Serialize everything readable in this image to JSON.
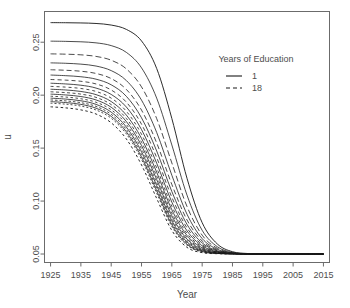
{
  "chart_data": {
    "type": "line",
    "title": "",
    "xlabel": "Year",
    "ylabel": "u",
    "xlim": [
      1923,
      2017
    ],
    "ylim": [
      0.042,
      0.279
    ],
    "xticks": [
      1925,
      1935,
      1945,
      1955,
      1965,
      1975,
      1985,
      1995,
      2005,
      2015
    ],
    "xtick_labels": [
      "1925",
      "1935",
      "1945",
      "1955",
      "1965",
      "1975",
      "1985",
      "1995",
      "2005",
      "2015"
    ],
    "yticks": [
      0.05,
      0.1,
      0.15,
      0.2,
      0.25
    ],
    "ytick_labels": [
      "0.05",
      "0.10",
      "0.15",
      "0.20",
      "0.25"
    ],
    "grid": false,
    "legend": {
      "title": "Years of Education",
      "position": "top-right",
      "entries": [
        {
          "label": "1",
          "dash": "solid"
        },
        {
          "label": "18",
          "dash": "dashed"
        }
      ]
    },
    "series_note": "18 logistic decay curves, one per year of education (1 = top/solid, 18 = bottom/dashed). All start on a plateau in 1925 and converge to u = 0.05 after ~1995.",
    "x": [
      1925,
      1930,
      1935,
      1940,
      1945,
      1950,
      1955,
      1960,
      1965,
      1970,
      1975,
      1980,
      1985,
      1990,
      1995,
      2000,
      2005,
      2010,
      2015
    ],
    "series": [
      {
        "name": "1",
        "values": [
          0.2685,
          0.2684,
          0.2682,
          0.2677,
          0.2662,
          0.2621,
          0.2512,
          0.2252,
          0.178,
          0.1215,
          0.0796,
          0.0595,
          0.0522,
          0.0505,
          0.0501,
          0.05,
          0.05,
          0.05,
          0.05
        ]
      },
      {
        "name": "2",
        "values": [
          0.251,
          0.2508,
          0.2504,
          0.2494,
          0.2468,
          0.2404,
          0.2258,
          0.1972,
          0.153,
          0.1056,
          0.0724,
          0.0569,
          0.0515,
          0.0503,
          0.05,
          0.05,
          0.05,
          0.05,
          0.05
        ]
      },
      {
        "name": "3",
        "values": [
          0.239,
          0.2387,
          0.2381,
          0.2366,
          0.233,
          0.2248,
          0.2078,
          0.1779,
          0.136,
          0.0949,
          0.0678,
          0.0554,
          0.0511,
          0.0502,
          0.05,
          0.05,
          0.05,
          0.05,
          0.05
        ]
      },
      {
        "name": "4",
        "values": [
          0.2305,
          0.2301,
          0.2293,
          0.2275,
          0.2232,
          0.2138,
          0.1953,
          0.1648,
          0.1244,
          0.0876,
          0.0646,
          0.0544,
          0.0509,
          0.0502,
          0.05,
          0.05,
          0.05,
          0.05,
          0.05
        ]
      },
      {
        "name": "5",
        "values": [
          0.224,
          0.2235,
          0.2226,
          0.2205,
          0.2157,
          0.2054,
          0.1859,
          0.1549,
          0.1157,
          0.0822,
          0.0623,
          0.0536,
          0.0508,
          0.0501,
          0.05,
          0.05,
          0.05,
          0.05,
          0.05
        ]
      },
      {
        "name": "6",
        "values": [
          0.219,
          0.2184,
          0.2174,
          0.2151,
          0.2098,
          0.1989,
          0.1786,
          0.1473,
          0.109,
          0.078,
          0.0605,
          0.053,
          0.0507,
          0.0501,
          0.05,
          0.05,
          0.05,
          0.05,
          0.05
        ]
      },
      {
        "name": "7",
        "values": [
          0.2148,
          0.2142,
          0.2131,
          0.2106,
          0.2049,
          0.1934,
          0.1726,
          0.1411,
          0.1036,
          0.0747,
          0.059,
          0.0525,
          0.0506,
          0.0501,
          0.05,
          0.05,
          0.05,
          0.05,
          0.05
        ]
      },
      {
        "name": "8",
        "values": [
          0.2113,
          0.2106,
          0.2094,
          0.2067,
          0.2007,
          0.1888,
          0.1675,
          0.1358,
          0.099,
          0.0719,
          0.0578,
          0.0522,
          0.0505,
          0.0501,
          0.05,
          0.05,
          0.05,
          0.05,
          0.05
        ]
      },
      {
        "name": "9",
        "values": [
          0.2083,
          0.2076,
          0.2063,
          0.2035,
          0.1972,
          0.1848,
          0.1631,
          0.1313,
          0.0951,
          0.0695,
          0.0568,
          0.0518,
          0.0505,
          0.0501,
          0.05,
          0.05,
          0.05,
          0.05,
          0.05
        ]
      },
      {
        "name": "10",
        "values": [
          0.2056,
          0.2049,
          0.2035,
          0.2005,
          0.194,
          0.1812,
          0.1592,
          0.1273,
          0.0918,
          0.0675,
          0.0559,
          0.0516,
          0.0504,
          0.0501,
          0.05,
          0.05,
          0.05,
          0.05,
          0.05
        ]
      },
      {
        "name": "11",
        "values": [
          0.2032,
          0.2024,
          0.201,
          0.1979,
          0.1911,
          0.178,
          0.1556,
          0.1237,
          0.0888,
          0.0657,
          0.0551,
          0.0513,
          0.0504,
          0.0501,
          0.05,
          0.05,
          0.05,
          0.05,
          0.05
        ]
      },
      {
        "name": "12",
        "values": [
          0.201,
          0.2002,
          0.1987,
          0.1955,
          0.1886,
          0.1751,
          0.1524,
          0.1204,
          0.0861,
          0.0641,
          0.0544,
          0.0511,
          0.0503,
          0.0501,
          0.05,
          0.05,
          0.05,
          0.05,
          0.05
        ]
      },
      {
        "name": "13",
        "values": [
          0.199,
          0.1982,
          0.1966,
          0.1933,
          0.1862,
          0.1724,
          0.1494,
          0.1174,
          0.0837,
          0.0627,
          0.0538,
          0.0509,
          0.0503,
          0.05,
          0.05,
          0.05,
          0.05,
          0.05,
          0.05
        ]
      },
      {
        "name": "14",
        "values": [
          0.1972,
          0.1963,
          0.1947,
          0.1913,
          0.184,
          0.1699,
          0.1466,
          0.1147,
          0.0815,
          0.0614,
          0.0533,
          0.0508,
          0.0502,
          0.05,
          0.05,
          0.05,
          0.05,
          0.05,
          0.05
        ]
      },
      {
        "name": "15",
        "values": [
          0.1955,
          0.1946,
          0.1929,
          0.1894,
          0.1819,
          0.1676,
          0.144,
          0.1121,
          0.0795,
          0.0603,
          0.0528,
          0.0507,
          0.0502,
          0.05,
          0.05,
          0.05,
          0.05,
          0.05,
          0.05
        ]
      },
      {
        "name": "16",
        "values": [
          0.1939,
          0.193,
          0.1913,
          0.1877,
          0.18,
          0.1654,
          0.1416,
          0.1097,
          0.0777,
          0.0592,
          0.0524,
          0.0506,
          0.0502,
          0.05,
          0.05,
          0.05,
          0.05,
          0.05,
          0.05
        ]
      },
      {
        "name": "17",
        "values": [
          0.1924,
          0.1915,
          0.1897,
          0.186,
          0.1782,
          0.1634,
          0.1393,
          0.1075,
          0.076,
          0.0583,
          0.052,
          0.0505,
          0.0501,
          0.05,
          0.05,
          0.05,
          0.05,
          0.05,
          0.05
        ]
      },
      {
        "name": "18",
        "values": [
          0.189,
          0.188,
          0.1861,
          0.1822,
          0.1739,
          0.1586,
          0.1341,
          0.1025,
          0.0723,
          0.0563,
          0.0513,
          0.0503,
          0.0501,
          0.05,
          0.05,
          0.05,
          0.05,
          0.05,
          0.05
        ]
      }
    ]
  },
  "axes": {
    "x_title": "Year",
    "y_title": "u"
  },
  "legend": {
    "title": "Years of Education",
    "first_label": "1",
    "last_label": "18"
  },
  "colors": {
    "line": "#1a1a1a",
    "axis": "#555555",
    "text": "#4d4d4d",
    "background": "#ffffff"
  }
}
